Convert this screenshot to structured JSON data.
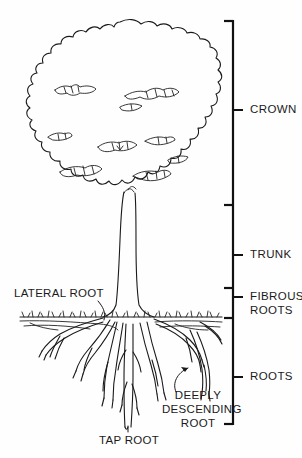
{
  "diagram": {
    "background_color": "#fefefe",
    "ink_color": "#1a1a1a"
  },
  "zone_labels": [
    {
      "id": "crown",
      "text": "CROWN",
      "x": 250,
      "y": 104,
      "tick_y": 110
    },
    {
      "id": "trunk",
      "text": "TRUNK",
      "x": 250,
      "y": 249,
      "tick_y": 255
    },
    {
      "id": "fibrous_roots",
      "text": "FIBROUS",
      "x": 250,
      "y": 291,
      "tick_y": 297
    },
    {
      "id": "fibrous_roots_2",
      "text": "ROOTS",
      "x": 250,
      "y": 305,
      "tick_y": 311
    },
    {
      "id": "roots",
      "text": "ROOTS",
      "x": 250,
      "y": 371,
      "tick_y": 377
    }
  ],
  "callouts": [
    {
      "id": "lateral_root",
      "text": "LATERAL ROOT",
      "x": 14,
      "y": 287
    },
    {
      "id": "tap_root",
      "text": "TAP ROOT",
      "x": 99,
      "y": 434
    }
  ],
  "callout_blocks": [
    {
      "id": "deeply_descending_root",
      "lines": [
        "DEEPLY",
        "DESCENDING",
        "ROOT"
      ],
      "x": 168,
      "y": 389
    }
  ],
  "bracket": {
    "x": 233,
    "top": 20,
    "bottom": 425,
    "foot_length": 9,
    "tick_length": 9,
    "segment_breaks": [
      205,
      288,
      318
    ]
  },
  "structure": {
    "crown_top": 22,
    "crown_bottom": 205,
    "ground_line": 317,
    "trunk_left": 118,
    "trunk_right": 137,
    "root_depth": 430
  }
}
